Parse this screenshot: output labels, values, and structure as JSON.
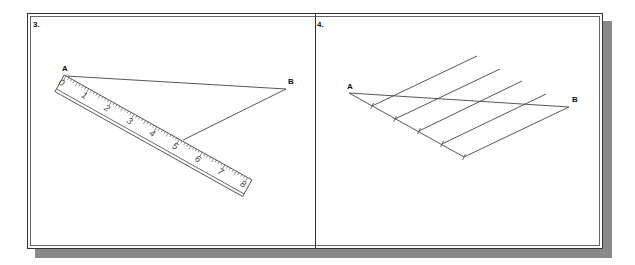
{
  "panels": [
    {
      "number": "3.",
      "points": {
        "A": {
          "label": "A",
          "x": 66,
          "y": 76
        },
        "B": {
          "label": "B",
          "x": 286,
          "y": 89
        }
      },
      "ruler": {
        "start": {
          "x": 66,
          "y": 76
        },
        "angle_deg": 29.2,
        "inch_px": 26,
        "labels": [
          "0",
          "1",
          "2",
          "3",
          "4",
          "5",
          "6",
          "7",
          "8"
        ]
      },
      "segment_AB": {
        "from": "A",
        "to": "B"
      },
      "construction_line": {
        "from": {
          "x": 286,
          "y": 89
        },
        "to": {
          "x": 183,
          "y": 140
        }
      }
    },
    {
      "number": "4.",
      "points": {
        "A": {
          "label": "A",
          "x": 349,
          "y": 93
        },
        "B": {
          "label": "B",
          "x": 569,
          "y": 107
        }
      },
      "divisions": 5,
      "ticks": [
        {
          "x": 372,
          "y": 106
        },
        {
          "x": 395,
          "y": 119
        },
        {
          "x": 419,
          "y": 131
        },
        {
          "x": 442,
          "y": 144
        },
        {
          "x": 464,
          "y": 157
        }
      ],
      "parallel_tops": [
        {
          "x": 477,
          "y": 56
        },
        {
          "x": 500,
          "y": 69
        },
        {
          "x": 522,
          "y": 81
        },
        {
          "x": 546,
          "y": 94
        },
        {
          "x": 569,
          "y": 107
        }
      ]
    }
  ],
  "colors": {
    "line": "#444444",
    "frame": "#333333",
    "shadow": "#8a8a8a",
    "background": "#ffffff"
  }
}
